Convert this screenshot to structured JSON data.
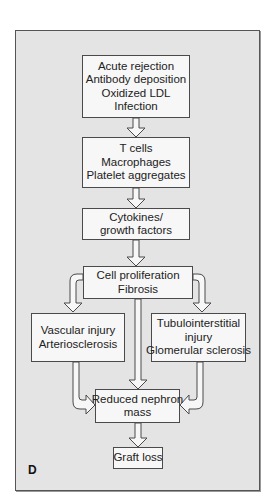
{
  "figure": {
    "panel_label": "D",
    "nodes": {
      "causes": {
        "lines": [
          "Acute rejection",
          "Antibody deposition",
          "Oxidized LDL",
          "Infection"
        ]
      },
      "cells": {
        "lines": [
          "T cells",
          "Macrophages",
          "Platelet aggregates"
        ]
      },
      "cytokines": {
        "lines": [
          "Cytokines/",
          "growth factors"
        ]
      },
      "proliferation": {
        "lines": [
          "Cell proliferation",
          "Fibrosis"
        ]
      },
      "vascular": {
        "lines": [
          "Vascular injury",
          "Arteriosclerosis"
        ]
      },
      "tubular": {
        "lines": [
          "Tubulointerstitial",
          "injury",
          "Glomerular sclerosis"
        ]
      },
      "nephron": {
        "lines": [
          "Reduced nephron",
          "mass"
        ]
      },
      "graft": {
        "lines": [
          "Graft loss"
        ]
      }
    },
    "edges": [
      [
        "causes",
        "cells"
      ],
      [
        "cells",
        "cytokines"
      ],
      [
        "cytokines",
        "proliferation"
      ],
      [
        "proliferation",
        "vascular"
      ],
      [
        "proliferation",
        "tubular"
      ],
      [
        "proliferation",
        "nephron"
      ],
      [
        "vascular",
        "nephron"
      ],
      [
        "tubular",
        "nephron"
      ],
      [
        "nephron",
        "graft"
      ]
    ],
    "colors": {
      "panel": "#e4e4e4",
      "box": "#f7f7f7",
      "stroke": "#4a4a4a"
    }
  }
}
